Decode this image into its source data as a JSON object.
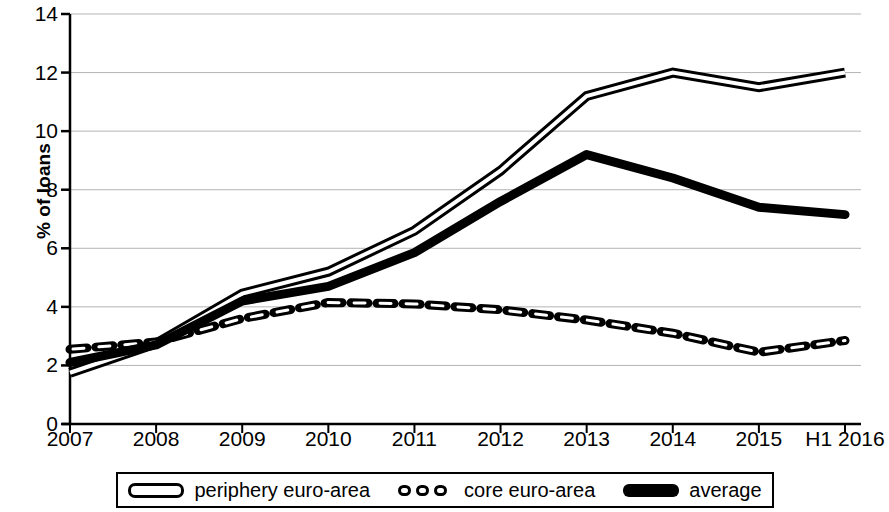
{
  "chart_data": {
    "type": "line",
    "title": "",
    "xlabel": "",
    "ylabel": "% of loans",
    "categories": [
      "2007",
      "2008",
      "2009",
      "2010",
      "2011",
      "2012",
      "2013",
      "2014",
      "2015",
      "H1 2016"
    ],
    "ylim": [
      0,
      14
    ],
    "yticks": [
      0,
      2,
      4,
      6,
      8,
      10,
      12,
      14
    ],
    "ytick_labels": [
      "0",
      "2",
      "4",
      "6",
      "8",
      "10",
      "12",
      "14"
    ],
    "grid": true,
    "legend_position": "bottom",
    "series": [
      {
        "name": "periphery euro-area",
        "style": "double-line",
        "color": "#000000",
        "values": [
          1.75,
          2.75,
          4.45,
          5.2,
          6.6,
          8.65,
          11.2,
          12.0,
          11.5,
          12.0
        ]
      },
      {
        "name": "core euro-area",
        "style": "dashed",
        "color": "#000000",
        "values": [
          2.55,
          2.8,
          3.6,
          4.15,
          4.1,
          3.9,
          3.55,
          3.1,
          2.45,
          2.85
        ]
      },
      {
        "name": "average",
        "style": "solid-thick",
        "color": "#000000",
        "values": [
          2.1,
          2.7,
          4.2,
          4.7,
          5.85,
          7.6,
          9.2,
          8.4,
          7.4,
          7.15
        ]
      }
    ]
  },
  "legend": {
    "items": [
      {
        "label": "periphery euro-area",
        "swatch": "double-line-swatch"
      },
      {
        "label": "core euro-area",
        "swatch": "dashed-line-swatch"
      },
      {
        "label": "average",
        "swatch": "solid-line-swatch"
      }
    ]
  },
  "axes": {
    "y_title": "% of loans",
    "axis_color": "#000000",
    "grid_color": "#b4b4b4"
  }
}
